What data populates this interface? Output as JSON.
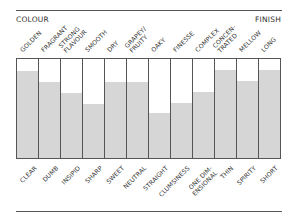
{
  "chart_data": {
    "type": "bar",
    "title": "",
    "left_label": "COLOUR",
    "right_label": "FINISH",
    "top_categories": [
      "GOLDEN",
      "FRAGRANT",
      "STRONG\nFLAVOUR",
      "SMOOTH",
      "DRY",
      "GRAPEY/\nFRUITY",
      "OAKY",
      "FINESSE",
      "COMPLEX",
      "CONCEN-\nTRATED",
      "MELLOW",
      "LONG"
    ],
    "bottom_categories": [
      "CLEAR",
      "DUMB",
      "INSIPID",
      "SHARP",
      "SWEET",
      "NEUTRAL",
      "STRAIGHT",
      "CLUMSINESS",
      "ONE DIM-\nENSIONAL",
      "THIN",
      "SPIRITY",
      "SHORT"
    ],
    "values": [
      88,
      77,
      66,
      55,
      77,
      77,
      45,
      56,
      67,
      89,
      78,
      89
    ],
    "ylim": [
      0,
      100
    ],
    "xlabel": "",
    "ylabel": "",
    "grid": false,
    "legend": null,
    "fill_color": "#d6d6d6",
    "line_color": "#555555"
  }
}
